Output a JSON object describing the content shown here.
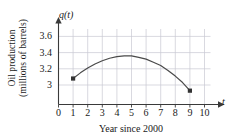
{
  "figure": {
    "axis_names": {
      "y": "q(t)",
      "x": "t"
    },
    "y_axis_title_line1": "Oil production",
    "y_axis_title_line2": "(millions of barrels)",
    "x_axis_title": "Year since 2000"
  },
  "chart_data": {
    "type": "line",
    "title": "",
    "subtitle": "",
    "xlabel": "Year since 2000",
    "ylabel": "Oil production (millions of barrels)",
    "x_axis_name": "t",
    "y_axis_name": "q(t)",
    "xlim": [
      0,
      10
    ],
    "ylim": [
      2.85,
      3.75
    ],
    "xticks": [
      0,
      1,
      2,
      3,
      4,
      5,
      6,
      7,
      8,
      9,
      10
    ],
    "xtick_labels": [
      "0",
      "1",
      "2",
      "3",
      "4",
      "5",
      "6",
      "7",
      "8",
      "9",
      "10"
    ],
    "yticks": [
      3,
      3.2,
      3.4,
      3.6
    ],
    "ytick_labels": [
      "3",
      "3.2",
      "3.4",
      "3.6"
    ],
    "grid": true,
    "legend": "none",
    "curve_color": "#4a4a4a",
    "grid_color": "#c8c8d2",
    "axis_color": "#3a3a3a",
    "series": [
      {
        "name": "q(t)",
        "x": [
          1,
          1.5,
          2,
          2.5,
          3,
          3.5,
          4,
          4.5,
          5,
          5.5,
          6,
          6.5,
          7,
          7.5,
          8,
          8.5,
          9
        ],
        "values": [
          3.08,
          3.15,
          3.21,
          3.26,
          3.3,
          3.33,
          3.35,
          3.36,
          3.36,
          3.34,
          3.32,
          3.28,
          3.24,
          3.18,
          3.11,
          3.03,
          2.93
        ]
      }
    ],
    "marked_points": [
      {
        "x": 1,
        "y": 3.08
      },
      {
        "x": 9,
        "y": 2.93
      }
    ]
  }
}
